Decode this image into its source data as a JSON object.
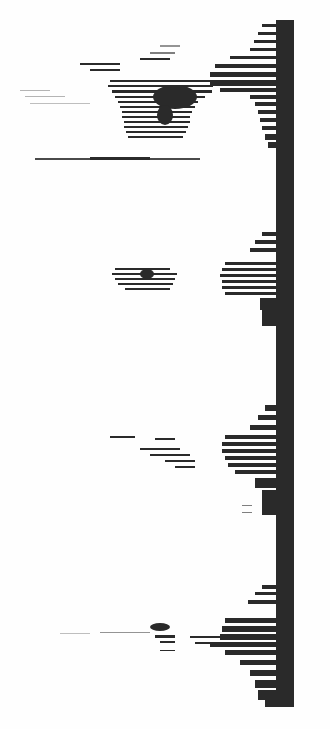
{
  "image": {
    "kind": "scanned spectrogram (rotated)",
    "background": "#fefefe",
    "ink": "#2a2a2a",
    "baseline_bar": {
      "x": 276,
      "y": 20,
      "width": 18,
      "height": 687
    },
    "clusters": [
      {
        "name": "cluster-1",
        "y_range": [
          20,
          170
        ]
      },
      {
        "name": "cluster-2",
        "y_range": [
          220,
          330
        ]
      },
      {
        "name": "cluster-3",
        "y_range": [
          400,
          520
        ]
      },
      {
        "name": "cluster-4",
        "y_range": [
          580,
          707
        ]
      }
    ]
  }
}
